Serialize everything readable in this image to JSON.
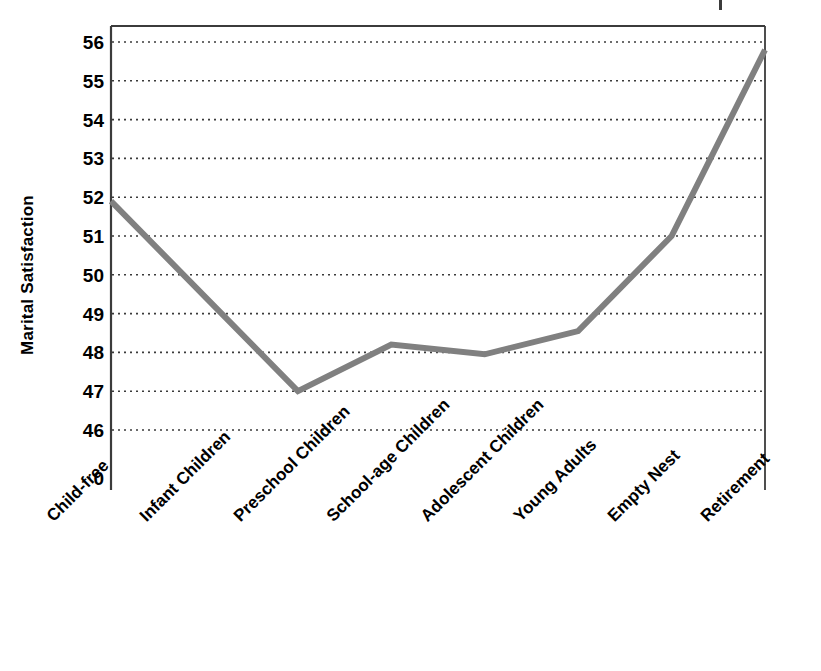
{
  "chart_data": {
    "type": "line",
    "title": "",
    "xlabel": "",
    "ylabel": "Marital Satisfaction",
    "categories": [
      "Child-free",
      "Infant Children",
      "Preschool Children",
      "School-age Children",
      "Adolescent Children",
      "Young Adults",
      "Empty Nest",
      "Retirement"
    ],
    "values": [
      51.9,
      49.45,
      47.0,
      48.2,
      47.95,
      48.55,
      51.0,
      55.8
    ],
    "ytick_labels": [
      "56",
      "55",
      "54",
      "53",
      "52",
      "51",
      "50",
      "49",
      "48",
      "47",
      "46",
      "0"
    ],
    "ytick_values": [
      56,
      55,
      54,
      53,
      52,
      51,
      50,
      49,
      48,
      47,
      46
    ],
    "ylim": [
      46,
      56
    ],
    "axis_break_label": "0",
    "grid": "horizontal-dotted",
    "legend": "none",
    "series_color": "#808080",
    "gridline_color": "#3b3b3b",
    "axis_color": "#3b3b3b",
    "text_color": "#000000",
    "line_width": 6
  },
  "chart": {
    "y_axis_title": "Marital Satisfaction"
  }
}
